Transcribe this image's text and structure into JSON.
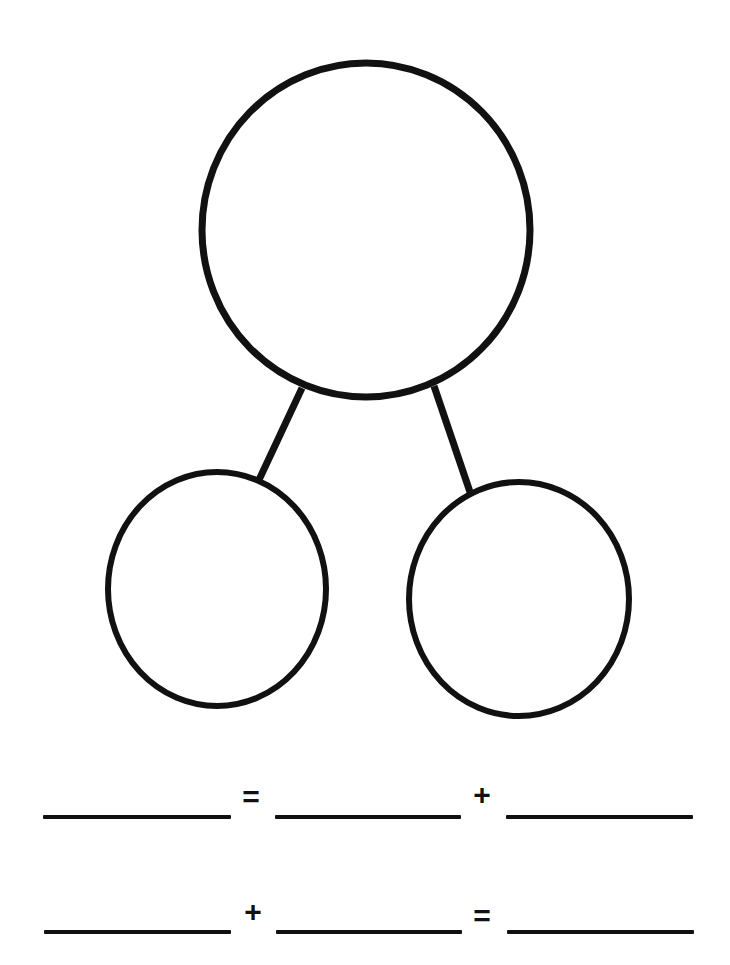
{
  "worksheet": {
    "type": "number-bond",
    "stroke_color": "#111111",
    "background_color": "#ffffff",
    "whole_circle": {
      "label": "",
      "cx": 366,
      "cy": 230,
      "rx": 164,
      "ry": 167
    },
    "part_circles": [
      {
        "label": "",
        "cx": 217,
        "cy": 589,
        "rx": 109,
        "ry": 117
      },
      {
        "label": "",
        "cx": 519,
        "cy": 599,
        "rx": 110,
        "ry": 117
      }
    ],
    "connectors": [
      {
        "x1": 302,
        "y1": 388,
        "x2": 258,
        "y2": 482
      },
      {
        "x1": 434,
        "y1": 386,
        "x2": 470,
        "y2": 492
      }
    ]
  },
  "equations": [
    {
      "blanks": [
        "",
        "",
        ""
      ],
      "operators": [
        "=",
        "+"
      ]
    },
    {
      "blanks": [
        "",
        "",
        ""
      ],
      "operators": [
        "+",
        "="
      ]
    }
  ]
}
